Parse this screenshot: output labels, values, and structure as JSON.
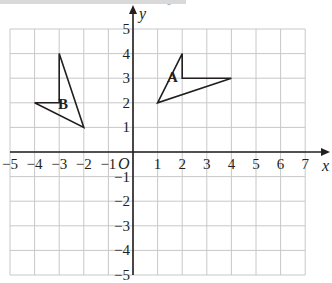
{
  "banner": {
    "badge_text": "GRADE"
  },
  "chart_data": {
    "type": "coordinate-grid",
    "title": "",
    "xlabel": "x",
    "ylabel": "y",
    "origin_label": "O",
    "xlim": [
      -5,
      7
    ],
    "ylim": [
      -5,
      5
    ],
    "grid": true,
    "x_ticks": [
      "-5",
      "-4",
      "-3",
      "-2",
      "-1",
      "1",
      "2",
      "3",
      "4",
      "5",
      "6",
      "7"
    ],
    "y_ticks": [
      "5",
      "4",
      "3",
      "2",
      "1",
      "-1",
      "-2",
      "-3",
      "-4",
      "-5"
    ],
    "shapes": [
      {
        "label": "A",
        "vertices": [
          [
            1,
            2
          ],
          [
            2,
            4
          ],
          [
            2,
            3
          ],
          [
            4,
            3
          ]
        ],
        "label_pos": [
          1.6,
          2.85
        ]
      },
      {
        "label": "B",
        "vertices": [
          [
            -3,
            4
          ],
          [
            -2,
            1
          ],
          [
            -4,
            2
          ],
          [
            -3,
            2
          ]
        ],
        "label_pos": [
          -2.85,
          1.75
        ]
      }
    ]
  },
  "colors": {
    "grid": "#c8c8c8",
    "axis": "#231f20",
    "shape": "#231f20",
    "banner": "#d9d9d9"
  }
}
